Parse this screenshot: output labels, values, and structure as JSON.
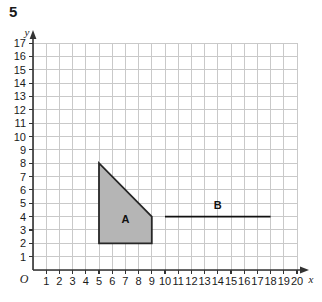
{
  "question": {
    "number": "5"
  },
  "chart_data": {
    "type": "scatter",
    "title": "",
    "xlabel": "x",
    "ylabel": "y",
    "xlim": [
      0,
      20
    ],
    "ylim": [
      0,
      17
    ],
    "grid": true,
    "legend": "none",
    "origin_label": "O",
    "x_ticks": [
      "1",
      "2",
      "3",
      "4",
      "5",
      "6",
      "7",
      "8",
      "9",
      "10",
      "11",
      "12",
      "13",
      "14",
      "15",
      "16",
      "17",
      "18",
      "19",
      "20"
    ],
    "y_ticks": [
      "1",
      "2",
      "3",
      "4",
      "5",
      "6",
      "7",
      "8",
      "9",
      "10",
      "11",
      "12",
      "13",
      "14",
      "15",
      "16",
      "17"
    ],
    "shapes": [
      {
        "name": "A",
        "label": "A",
        "kind": "polygon",
        "fill": "#b5b5b5",
        "stroke": "#262626",
        "points": [
          [
            5,
            2
          ],
          [
            5,
            8
          ],
          [
            9,
            4
          ],
          [
            9,
            2
          ]
        ],
        "label_at": [
          7.0,
          3.55
        ]
      },
      {
        "name": "B",
        "label": "B",
        "kind": "segment",
        "stroke": "#111111",
        "points": [
          [
            10,
            4
          ],
          [
            18,
            4
          ]
        ],
        "label_at": [
          14.0,
          4.6
        ]
      }
    ],
    "colors": {
      "grid": "#c9c9c9",
      "axis": "#333333",
      "shape_a_fill": "#b5b5b5",
      "shape_a_stroke": "#262626",
      "line_b": "#111111",
      "background": "#ffffff"
    }
  }
}
